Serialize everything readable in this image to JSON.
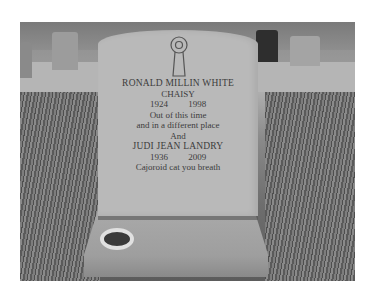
{
  "photo": {
    "subject": "Granite headstone in a cemetery with a flower vase holder on the base",
    "inscription": {
      "emblem": "keyhole-ribbon-emblem",
      "person1": {
        "name": "RONALD MILLIN WHITE",
        "nickname": "CHAISY",
        "dates": "1924 1998"
      },
      "verse_line1": "Out of this time",
      "verse_line2": "and in a different place",
      "conjunction": "And",
      "person2": {
        "name": "JUDI JEAN LANDRY",
        "dates": "1936 2009"
      },
      "closing": "Cajoroid cat you breath"
    }
  }
}
